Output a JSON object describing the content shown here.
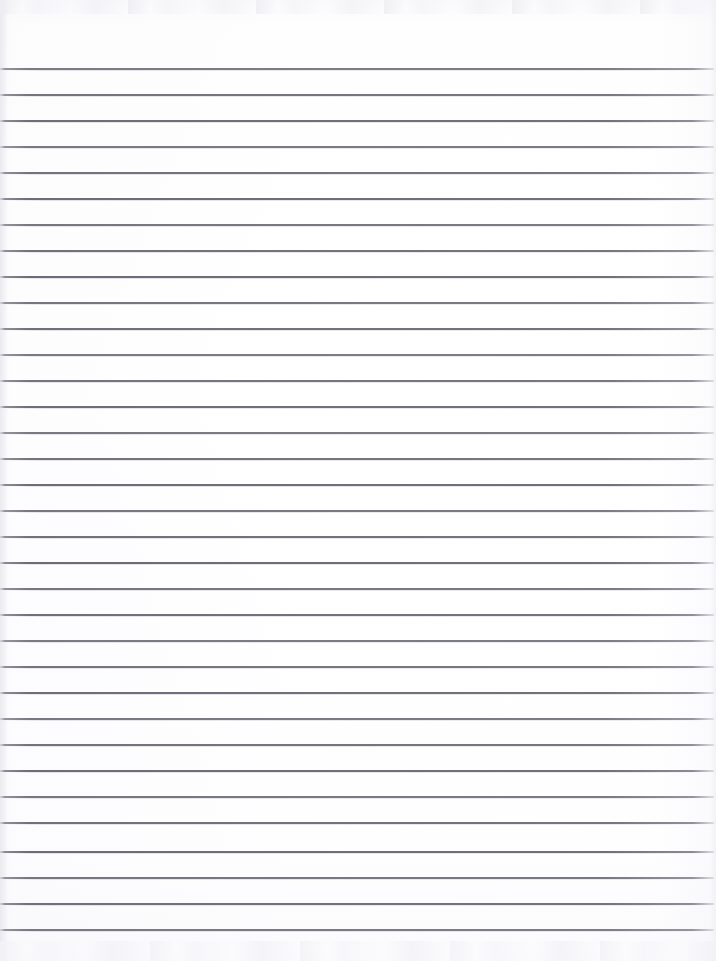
{
  "document": {
    "type": "scanned-lined-notebook-page",
    "title": "Blank Lined Paper",
    "page_width": 716,
    "page_height": 961,
    "background_color": "#fdfdfe",
    "has_text_content": false,
    "text_content": "",
    "margin_rule": "none",
    "header_text": "",
    "footer_text": ""
  },
  "ruling": {
    "line_color": "#6c6c76",
    "line_thickness_px": 2,
    "line_spacing_px": 26,
    "first_line_y": 68,
    "last_line_y": 929,
    "line_count": 34,
    "line_start_x": 0,
    "line_end_x": 714,
    "top_blank_margin_px": 68,
    "bottom_blank_margin_px": 32,
    "line_positions": [
      68,
      94,
      120,
      146,
      172,
      198,
      224,
      250,
      276,
      302,
      328,
      354,
      380,
      406,
      432,
      458,
      484,
      510,
      536,
      562,
      588,
      614,
      640,
      666,
      692,
      718,
      744,
      770,
      796,
      822,
      851,
      877,
      903,
      929
    ]
  },
  "scan_artifacts": {
    "top_noise_band": true,
    "bottom_noise_band": true,
    "left_edge_shadow": true,
    "right_edge_shadow": true
  }
}
